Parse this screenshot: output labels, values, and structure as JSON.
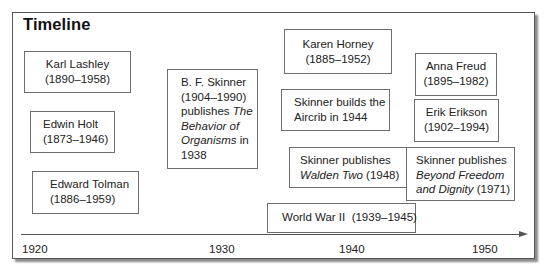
{
  "title": "Timeline",
  "boxes": {
    "lashley": {
      "line1": "Karl Lashley",
      "line2": "(1890–1958)"
    },
    "holt": {
      "line1": "Edwin Holt",
      "line2": "(1873–1946)"
    },
    "tolman": {
      "line1": "Edward Tolman",
      "line2": "(1886–1959)"
    },
    "skinner_behavior": {
      "line1": "B. F. Skinner",
      "line2": "(1904–1990)",
      "line3_plain": "publishes ",
      "line3_italic": "The",
      "line4_italic": "Behavior of",
      "line5_italic": "Organisms",
      "line5_plain": " in",
      "line6": "1938"
    },
    "horney": {
      "line1": "Karen Horney",
      "line2": "(1885–1952)"
    },
    "aircrib": {
      "line1": "Skinner builds the",
      "line2": "Aircrib in 1944"
    },
    "walden": {
      "line1": "Skinner publishes",
      "line2_italic": "Walden Two",
      "line2_plain": " (1948)"
    },
    "wwii": {
      "line1": "World War II  (1939–1945)"
    },
    "freud": {
      "line1": "Anna Freud",
      "line2": "(1895–1982)"
    },
    "erikson": {
      "line1": "Erik Erikson",
      "line2": "(1902–1994)"
    },
    "beyond": {
      "line1": "Skinner publishes",
      "line2_italic": "Beyond Freedom",
      "line3_italic": "and Dignity",
      "line3_plain": " (1971)"
    }
  },
  "axis": {
    "ticks": [
      "1920",
      "1930",
      "1940",
      "1950"
    ]
  },
  "events": [
    {
      "label": "Karl Lashley",
      "start": 1890,
      "end": 1958
    },
    {
      "label": "Edwin Holt",
      "start": 1873,
      "end": 1946
    },
    {
      "label": "Edward Tolman",
      "start": 1886,
      "end": 1959
    },
    {
      "label": "B. F. Skinner publishes The Behavior of Organisms",
      "year": 1938
    },
    {
      "label": "Karen Horney",
      "start": 1885,
      "end": 1952
    },
    {
      "label": "Skinner builds the Aircrib",
      "year": 1944
    },
    {
      "label": "Skinner publishes Walden Two",
      "year": 1948
    },
    {
      "label": "World War II",
      "start": 1939,
      "end": 1945
    },
    {
      "label": "Anna Freud",
      "start": 1895,
      "end": 1982
    },
    {
      "label": "Erik Erikson",
      "start": 1902,
      "end": 1994
    },
    {
      "label": "Skinner publishes Beyond Freedom and Dignity",
      "year": 1971
    }
  ]
}
